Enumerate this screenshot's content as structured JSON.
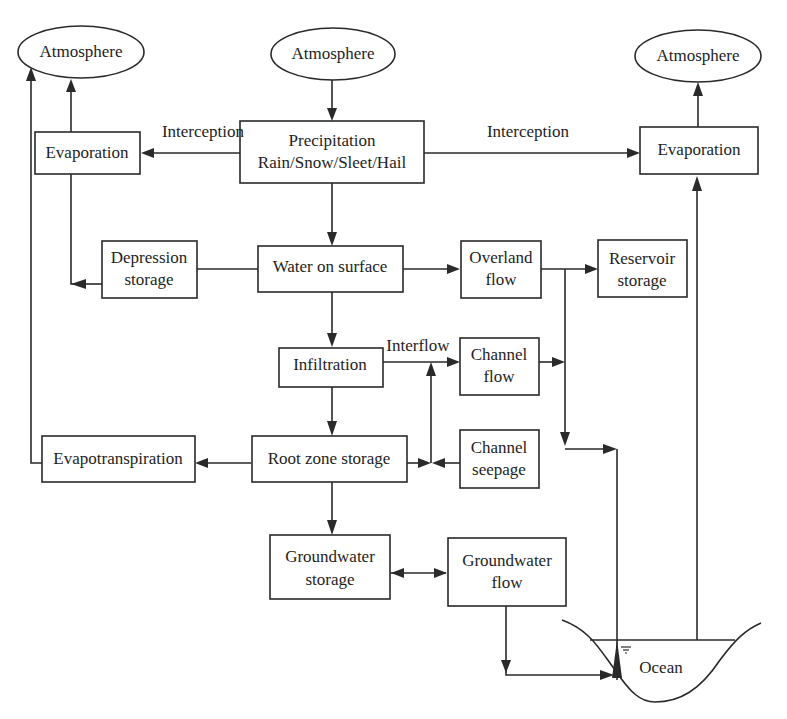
{
  "diagram": {
    "nodes": {
      "atmosphere_left": {
        "label": "Atmosphere",
        "shape": "ellipse"
      },
      "atmosphere_center": {
        "label": "Atmosphere",
        "shape": "ellipse"
      },
      "atmosphere_right": {
        "label": "Atmosphere",
        "shape": "ellipse"
      },
      "precipitation": {
        "line1": "Precipitation",
        "line2": "Rain/Snow/Sleet/Hail",
        "shape": "box"
      },
      "evaporation_left": {
        "label": "Evaporation",
        "shape": "box"
      },
      "evaporation_right": {
        "label": "Evaporation",
        "shape": "box"
      },
      "depression_storage": {
        "line1": "Depression",
        "line2": "storage",
        "shape": "box"
      },
      "water_on_surface": {
        "label": "Water on surface",
        "shape": "box"
      },
      "overland_flow": {
        "line1": "Overland",
        "line2": "flow",
        "shape": "box"
      },
      "reservoir_storage": {
        "line1": "Reservoir",
        "line2": "storage",
        "shape": "box"
      },
      "infiltration": {
        "label": "Infiltration",
        "shape": "box"
      },
      "channel_flow": {
        "line1": "Channel",
        "line2": "flow",
        "shape": "box"
      },
      "evapotranspiration": {
        "label": "Evapotranspiration",
        "shape": "box"
      },
      "root_zone_storage": {
        "label": "Root zone storage",
        "shape": "box"
      },
      "channel_seepage": {
        "line1": "Channel",
        "line2": "seepage",
        "shape": "box"
      },
      "groundwater_storage": {
        "line1": "Groundwater",
        "line2": "storage",
        "shape": "box"
      },
      "groundwater_flow": {
        "line1": "Groundwater",
        "line2": "flow",
        "shape": "box"
      },
      "ocean": {
        "label": "Ocean",
        "shape": "basin"
      }
    },
    "edge_labels": {
      "interception_left": "Interception",
      "interception_right": "Interception",
      "interflow": "Interflow"
    },
    "edges": [
      {
        "from": "atmosphere_center",
        "to": "precipitation"
      },
      {
        "from": "precipitation",
        "to": "evaporation_left",
        "label": "Interception"
      },
      {
        "from": "precipitation",
        "to": "evaporation_right",
        "label": "Interception"
      },
      {
        "from": "evaporation_left",
        "to": "atmosphere_left"
      },
      {
        "from": "evaporation_right",
        "to": "atmosphere_right"
      },
      {
        "from": "precipitation",
        "to": "water_on_surface"
      },
      {
        "from": "water_on_surface",
        "to": "depression_storage"
      },
      {
        "from": "depression_storage",
        "to": "evaporation_left"
      },
      {
        "from": "water_on_surface",
        "to": "overland_flow"
      },
      {
        "from": "overland_flow",
        "to": "reservoir_storage"
      },
      {
        "from": "water_on_surface",
        "to": "infiltration"
      },
      {
        "from": "infiltration",
        "to": "channel_flow",
        "label": "Interflow"
      },
      {
        "from": "infiltration",
        "to": "root_zone_storage"
      },
      {
        "from": "root_zone_storage",
        "to": "evapotranspiration"
      },
      {
        "from": "evapotranspiration",
        "to": "atmosphere_left"
      },
      {
        "from": "channel_seepage",
        "to": "root_zone_storage"
      },
      {
        "from": "root_zone_storage",
        "to": "channel_flow"
      },
      {
        "from": "channel_flow",
        "to": "ocean"
      },
      {
        "from": "overland_flow",
        "to": "ocean"
      },
      {
        "from": "root_zone_storage",
        "to": "groundwater_storage"
      },
      {
        "from": "groundwater_storage",
        "to": "groundwater_flow",
        "bidirectional": true
      },
      {
        "from": "groundwater_flow",
        "to": "ocean"
      },
      {
        "from": "ocean",
        "to": "evaporation_right"
      }
    ]
  }
}
